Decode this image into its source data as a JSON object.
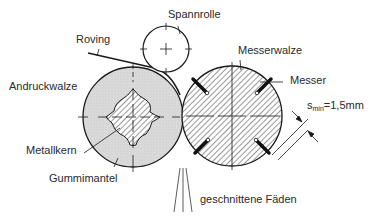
{
  "diagram": {
    "type": "technical-schematic",
    "labels": {
      "spannrolle": "Spannrolle",
      "roving": "Roving",
      "messerwalze": "Messerwalze",
      "messer": "Messer",
      "andruckwalze": "Andruckwalze",
      "metallkern": "Metallkern",
      "gummimantel": "Gummimantel",
      "geschnittene_faeden": "geschnittene Fäden",
      "dimension_symbol": "s",
      "dimension_subscript": "min",
      "dimension_value": "=1,5mm"
    },
    "components": [
      {
        "name": "Spannrolle",
        "shape": "circle",
        "center": [
          166,
          49
        ],
        "radius": 23,
        "fill": "none"
      },
      {
        "name": "Andruckwalze",
        "shape": "circle",
        "center": [
          133,
          117
        ],
        "radius": 50,
        "fill": "#d9d9d9",
        "core": "Metallkern",
        "shell": "Gummimantel"
      },
      {
        "name": "Messerwalze",
        "shape": "circle",
        "center": [
          232,
          116
        ],
        "radius": 50,
        "fill": "hatched",
        "knives": 4
      }
    ],
    "colors": {
      "line": "#1a1a1a",
      "rubber_fill": "#d9d9d9",
      "background": "#ffffff"
    }
  }
}
